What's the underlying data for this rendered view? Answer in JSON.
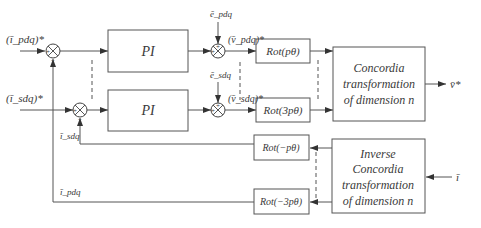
{
  "diagram": {
    "type": "block-diagram",
    "title": "",
    "inputs": {
      "ref_p": "(ī_pdq)*",
      "ref_s": "(ī_sdq)*",
      "meas": "ī"
    },
    "output": "v̄*",
    "blocks": {
      "pi1": "PI",
      "pi2": "PI",
      "rot1": "Rot(pθ)",
      "rot2": "Rot(3pθ)",
      "rot3": "Rot(−pθ)",
      "rot4": "Rot(−3pθ)",
      "concordia": [
        "Concordia",
        "transformation",
        "of dimension n"
      ],
      "inverse_concordia": [
        "Inverse",
        "Concordia",
        "transformation",
        "of dimension n"
      ]
    },
    "signals": {
      "e_p": "ē_pdq",
      "e_s": "ē_sdq",
      "v_p": "(v̄_pdq)*",
      "v_s": "(v̄_sdq)*",
      "i_s_fb": "ī_sdq",
      "i_p_fb": "ī_pdq"
    },
    "sums": {
      "sum1": {
        "signs": [
          "+",
          "−"
        ]
      },
      "sum2": {
        "signs": [
          "+",
          "−"
        ]
      },
      "sum3": {
        "signs": [
          "+",
          "+"
        ]
      },
      "sum4": {
        "signs": [
          "+",
          "+"
        ]
      }
    },
    "colors": {
      "line": "#555555",
      "text": "#3a3a3a",
      "background": "#ffffff"
    }
  }
}
